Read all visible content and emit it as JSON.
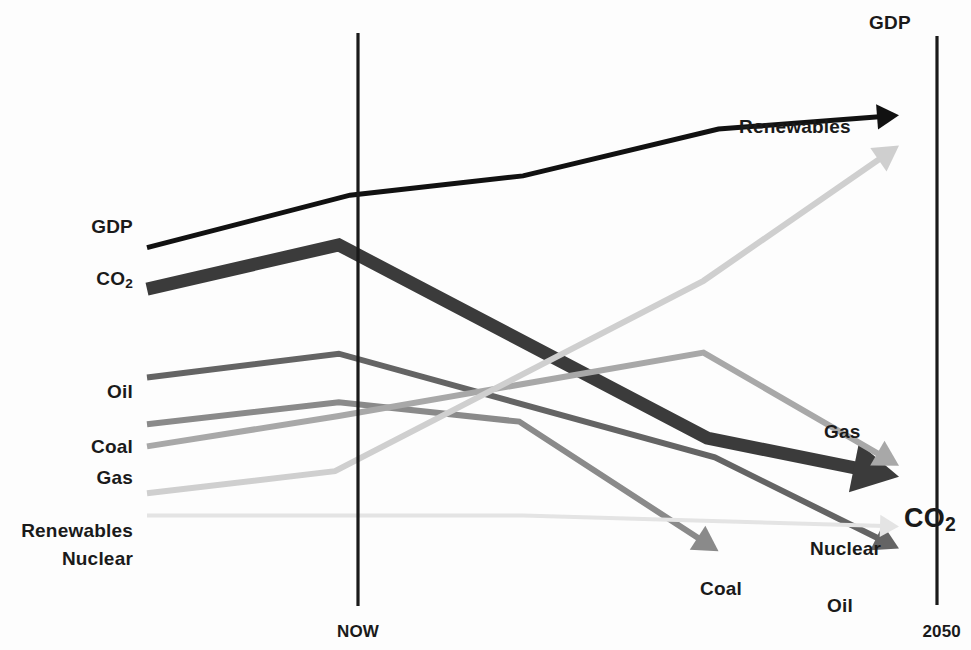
{
  "chart_data": {
    "type": "line",
    "title": "",
    "xlabel": "",
    "ylabel": "",
    "grid": false,
    "legend_position": "inline-endpoint-labels",
    "x_axis": {
      "tick_labels": [
        "NOW",
        "2050"
      ],
      "range_label_start": "NOW",
      "range_label_end": "2050"
    },
    "annotations": [
      "GDP keeps rising while CO2 peaks around NOW and then falls steeply to 2050",
      "Renewables rise steeply after NOW",
      "Coal, Oil, Gas and Nuclear all decline toward 2050"
    ],
    "series": [
      {
        "name": "GDP",
        "color": "#111111",
        "stroke_width": 5,
        "arrow": true,
        "style": "solid",
        "start_label": "GDP",
        "end_label": "GDP",
        "points": [
          {
            "x": 0.0,
            "y": 0.66
          },
          {
            "x": 0.27,
            "y": 0.755
          },
          {
            "x": 0.5,
            "y": 0.79
          },
          {
            "x": 0.76,
            "y": 0.875
          },
          {
            "x": 1.0,
            "y": 0.9
          }
        ]
      },
      {
        "name": "CO2",
        "color": "#3b3b3b",
        "stroke_width": 13,
        "arrow": true,
        "style": "solid",
        "start_label": "CO₂",
        "end_label": "CO₂",
        "points": [
          {
            "x": 0.0,
            "y": 0.585
          },
          {
            "x": 0.255,
            "y": 0.665
          },
          {
            "x": 0.745,
            "y": 0.315
          },
          {
            "x": 1.0,
            "y": 0.245
          }
        ]
      },
      {
        "name": "Oil",
        "color": "#646464",
        "stroke_width": 6,
        "arrow": true,
        "style": "solid",
        "start_label": "Oil",
        "end_label": "Oil",
        "points": [
          {
            "x": 0.0,
            "y": 0.425
          },
          {
            "x": 0.255,
            "y": 0.468
          },
          {
            "x": 0.755,
            "y": 0.28
          },
          {
            "x": 1.0,
            "y": 0.115
          }
        ]
      },
      {
        "name": "Coal",
        "color": "#8a8a8a",
        "stroke_width": 6,
        "arrow": true,
        "style": "solid",
        "start_label": "Coal",
        "end_label": "Coal",
        "points": [
          {
            "x": 0.0,
            "y": 0.34
          },
          {
            "x": 0.255,
            "y": 0.38
          },
          {
            "x": 0.495,
            "y": 0.345
          },
          {
            "x": 0.76,
            "y": 0.11
          }
        ]
      },
      {
        "name": "Gas",
        "color": "#a8a8a8",
        "stroke_width": 6,
        "arrow": true,
        "style": "solid",
        "start_label": "Gas",
        "end_label": "Gas",
        "points": [
          {
            "x": 0.0,
            "y": 0.3
          },
          {
            "x": 0.255,
            "y": 0.355
          },
          {
            "x": 0.74,
            "y": 0.47
          },
          {
            "x": 1.0,
            "y": 0.265
          }
        ]
      },
      {
        "name": "Renewables",
        "color": "#cfcfcf",
        "stroke_width": 6,
        "arrow": true,
        "style": "solid",
        "start_label": "Renewables",
        "end_label": "Renewables",
        "points": [
          {
            "x": 0.0,
            "y": 0.215
          },
          {
            "x": 0.25,
            "y": 0.255
          },
          {
            "x": 0.74,
            "y": 0.6
          },
          {
            "x": 1.0,
            "y": 0.845
          }
        ]
      },
      {
        "name": "Nuclear",
        "color": "#e4e4e4",
        "stroke_width": 4,
        "arrow": true,
        "style": "solid",
        "start_label": "Nuclear",
        "end_label": "Nuclear",
        "points": [
          {
            "x": 0.0,
            "y": 0.175
          },
          {
            "x": 0.5,
            "y": 0.175
          },
          {
            "x": 1.0,
            "y": 0.155
          }
        ]
      }
    ]
  },
  "axes": {
    "now_label": "NOW",
    "end_label": "2050",
    "now_line_color": "#1a1a1a",
    "end_line_color": "#1a1a1a"
  },
  "labels": {
    "left": [
      {
        "key": "gdp",
        "text": "GDP",
        "x": 133,
        "y": 226
      },
      {
        "key": "co2",
        "text": "CO",
        "sub": "2",
        "x": 133,
        "y": 278
      },
      {
        "key": "oil",
        "text": "Oil",
        "x": 133,
        "y": 391
      },
      {
        "key": "coal",
        "text": "Coal",
        "x": 133,
        "y": 446
      },
      {
        "key": "gas",
        "text": "Gas",
        "x": 133,
        "y": 477
      },
      {
        "key": "renewables",
        "text": "Renewables",
        "x": 133,
        "y": 530
      },
      {
        "key": "nuclear",
        "text": "Nuclear",
        "x": 133,
        "y": 558
      }
    ],
    "right": [
      {
        "key": "gdp",
        "text": "GDP",
        "x": 869,
        "y": 22
      },
      {
        "key": "renewables",
        "text": "Renewables",
        "x": 739,
        "y": 126
      },
      {
        "key": "gas",
        "text": "Gas",
        "x": 824,
        "y": 431
      },
      {
        "key": "co2",
        "text": "CO",
        "sub": "2",
        "x": 904,
        "y": 518,
        "big": true
      },
      {
        "key": "nuclear",
        "text": "Nuclear",
        "x": 810,
        "y": 548
      },
      {
        "key": "coal",
        "text": "Coal",
        "x": 700,
        "y": 588
      },
      {
        "key": "oil",
        "text": "Oil",
        "x": 827,
        "y": 605
      }
    ]
  },
  "colors": {
    "gdp": "#111111",
    "co2": "#3b3b3b",
    "oil": "#646464",
    "coal": "#8a8a8a",
    "gas": "#a8a8a8",
    "renewables": "#cfcfcf",
    "nuclear": "#e4e4e4",
    "axis": "#1a1a1a",
    "background": "#fdfdfd"
  }
}
